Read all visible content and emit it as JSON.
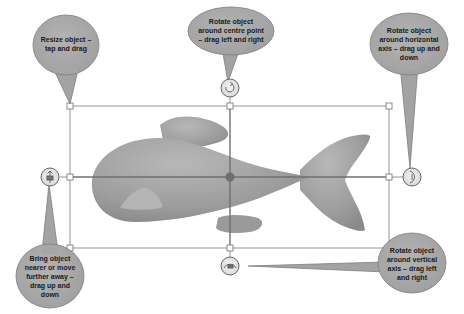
{
  "diagram": {
    "colors": {
      "callout_fill": "#a9a9a9",
      "callout_stroke": "#7d7d7d",
      "fish": "#9a9a9a",
      "fish_highlight": "#b6b6b6",
      "box_line": "#7a7a7a",
      "handle_fill": "#ffffff",
      "center_dot": "#6e6e6e"
    },
    "callouts": [
      {
        "id": "resize",
        "text": "Resize object –\ntap and drag"
      },
      {
        "id": "rotate-centre",
        "text": "Rotate object\naround centre point\n– drag left and right"
      },
      {
        "id": "rotate-horizontal",
        "text": "Rotate object\naround horizontal\naxis – drag up and\ndown"
      },
      {
        "id": "depth",
        "text": "Bring object\nnearer or move\nfurther away –\ndrag up and\ndown"
      },
      {
        "id": "rotate-vertical",
        "text": "Rotate object\naround vertical\naxis – drag left\nand right"
      }
    ],
    "controls": {
      "rotate_centre_icon": "circular-arrow-icon",
      "rotate_horizontal_icon": "horizontal-axis-rotate-icon",
      "depth_icon": "depth-move-icon",
      "rotate_vertical_icon": "vertical-axis-rotate-icon"
    }
  }
}
